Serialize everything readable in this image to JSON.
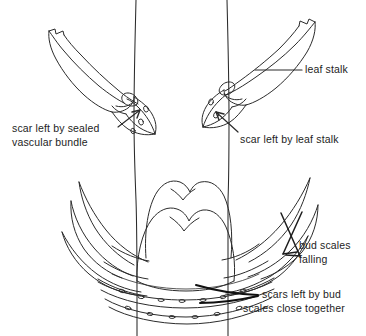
{
  "figure": {
    "background_color": "#ffffff",
    "ink_color": "#2b2b2b",
    "text_color": "#1d1d1d"
  },
  "labels": {
    "leaf_stalk": "leaf stalk",
    "sealed_bundle_line1": "scar left by sealed",
    "sealed_bundle_line2": "vascular bundle",
    "leaf_stalk_scar": "scar left by leaf stalk",
    "bud_scales_line1": "bud scales",
    "bud_scales_line2": "falling",
    "bud_scars_line1": "scars left by bud",
    "bud_scars_line2": "scales close together"
  },
  "parts": {
    "stem": "stem",
    "left_leaf_stalk": "left leaf stalk",
    "right_leaf_stalk": "right leaf stalk",
    "left_leaf_scar": "left leaf scar face",
    "right_leaf_scar": "right leaf scar face",
    "terminal_bud": "terminal bud",
    "bud_scales": "bud scales",
    "bud_scale_scars": "bud scale scar rings",
    "vascular_bundle_dots": "vascular bundle dots"
  }
}
